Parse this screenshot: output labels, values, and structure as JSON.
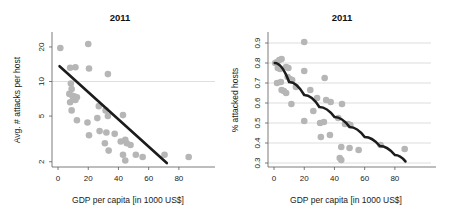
{
  "figure": {
    "background_color": "#ffffff",
    "point_color": "#b6b6b6",
    "line_color": "#1c1c1c",
    "grid_color": "#c8c8c8",
    "axis_color": "#5a5a5a"
  },
  "panels": {
    "left": {
      "title": "2011",
      "xlabel": "GDP per capita [in 1000 US$]",
      "ylabel": "Avg. # attacks per host",
      "xticks": [
        "0",
        "20",
        "40",
        "60",
        "80"
      ],
      "yticks": [
        "20",
        "10",
        "5",
        "2"
      ]
    },
    "right": {
      "title": "2011",
      "xlabel": "GDP per capita [in 1000 US$]",
      "ylabel": "% attacked hosts",
      "xticks": [
        "0",
        "20",
        "40",
        "60",
        "80"
      ],
      "yticks": [
        "0.9",
        "0.8",
        "0.7",
        "0.6",
        "0.5",
        "0.4",
        "0.3"
      ]
    }
  },
  "chart_data": [
    {
      "type": "scatter",
      "panel": "left",
      "title": "2011",
      "xlabel": "GDP per capita [in 1000 US$]",
      "ylabel": "Avg. # attacks per host",
      "yscale": "log",
      "xlim": [
        -4,
        92
      ],
      "ylim": [
        1.8,
        23
      ],
      "xticks": [
        0,
        20,
        40,
        60,
        80
      ],
      "yticks": [
        20,
        10,
        5,
        2
      ],
      "grid": "horizontal-at-10",
      "legend": "none",
      "points": [
        {
          "x": 1.5,
          "y": 19.6
        },
        {
          "x": 20.0,
          "y": 21.2
        },
        {
          "x": 8.0,
          "y": 13.2
        },
        {
          "x": 11.5,
          "y": 13.3
        },
        {
          "x": 20.5,
          "y": 13.0
        },
        {
          "x": 33.0,
          "y": 11.6
        },
        {
          "x": 8.5,
          "y": 9.6
        },
        {
          "x": 9.0,
          "y": 8.6
        },
        {
          "x": 7.5,
          "y": 7.8
        },
        {
          "x": 9.5,
          "y": 7.5
        },
        {
          "x": 11.0,
          "y": 7.4
        },
        {
          "x": 12.5,
          "y": 7.3
        },
        {
          "x": 8.0,
          "y": 6.6
        },
        {
          "x": 10.0,
          "y": 7.0
        },
        {
          "x": 11.5,
          "y": 6.9
        },
        {
          "x": 9.0,
          "y": 5.6
        },
        {
          "x": 27.0,
          "y": 6.1
        },
        {
          "x": 31.5,
          "y": 5.6
        },
        {
          "x": 12.5,
          "y": 4.6
        },
        {
          "x": 19.5,
          "y": 4.4
        },
        {
          "x": 26.0,
          "y": 4.8
        },
        {
          "x": 33.0,
          "y": 5.0
        },
        {
          "x": 43.0,
          "y": 5.1
        },
        {
          "x": 20.5,
          "y": 3.4
        },
        {
          "x": 27.5,
          "y": 3.7
        },
        {
          "x": 32.0,
          "y": 3.6
        },
        {
          "x": 37.5,
          "y": 3.5
        },
        {
          "x": 31.0,
          "y": 2.9
        },
        {
          "x": 41.5,
          "y": 3.0
        },
        {
          "x": 44.5,
          "y": 3.1
        },
        {
          "x": 45.5,
          "y": 2.9
        },
        {
          "x": 48.0,
          "y": 2.8
        },
        {
          "x": 33.5,
          "y": 2.5
        },
        {
          "x": 43.0,
          "y": 2.3
        },
        {
          "x": 44.5,
          "y": 2.05
        },
        {
          "x": 51.5,
          "y": 2.3
        },
        {
          "x": 56.0,
          "y": 2.2
        },
        {
          "x": 70.5,
          "y": 2.3
        },
        {
          "x": 86.5,
          "y": 2.2
        }
      ],
      "fit": {
        "type": "line",
        "x0": 1.0,
        "y0": 13.6,
        "x1": 72.0,
        "y1": 1.95
      }
    },
    {
      "type": "scatter",
      "panel": "right",
      "title": "2011",
      "xlabel": "GDP per capita [in 1000 US$]",
      "ylabel": "% attacked hosts",
      "yscale": "linear",
      "xlim": [
        -4,
        92
      ],
      "ylim": [
        0.28,
        0.93
      ],
      "xticks": [
        0,
        20,
        40,
        60,
        80
      ],
      "yticks": [
        0.9,
        0.8,
        0.7,
        0.6,
        0.5,
        0.4,
        0.3
      ],
      "grid": "horizontal",
      "legend": "none",
      "points": [
        {
          "x": 20.0,
          "y": 0.905
        },
        {
          "x": 0.8,
          "y": 0.8
        },
        {
          "x": 2.0,
          "y": 0.805
        },
        {
          "x": 3.5,
          "y": 0.815
        },
        {
          "x": 5.0,
          "y": 0.82
        },
        {
          "x": 2.5,
          "y": 0.775
        },
        {
          "x": 4.0,
          "y": 0.77
        },
        {
          "x": 8.0,
          "y": 0.78
        },
        {
          "x": 9.5,
          "y": 0.775
        },
        {
          "x": 20.0,
          "y": 0.76
        },
        {
          "x": 2.0,
          "y": 0.7
        },
        {
          "x": 4.5,
          "y": 0.705
        },
        {
          "x": 9.0,
          "y": 0.73
        },
        {
          "x": 10.5,
          "y": 0.72
        },
        {
          "x": 12.0,
          "y": 0.715
        },
        {
          "x": 33.5,
          "y": 0.725
        },
        {
          "x": 5.0,
          "y": 0.665
        },
        {
          "x": 6.5,
          "y": 0.66
        },
        {
          "x": 8.0,
          "y": 0.65
        },
        {
          "x": 14.5,
          "y": 0.68
        },
        {
          "x": 24.0,
          "y": 0.665
        },
        {
          "x": 11.5,
          "y": 0.595
        },
        {
          "x": 28.5,
          "y": 0.625
        },
        {
          "x": 34.5,
          "y": 0.615
        },
        {
          "x": 37.5,
          "y": 0.605
        },
        {
          "x": 45.0,
          "y": 0.595
        },
        {
          "x": 26.0,
          "y": 0.56
        },
        {
          "x": 20.0,
          "y": 0.51
        },
        {
          "x": 30.5,
          "y": 0.5
        },
        {
          "x": 33.0,
          "y": 0.505
        },
        {
          "x": 42.5,
          "y": 0.525
        },
        {
          "x": 47.0,
          "y": 0.495
        },
        {
          "x": 49.0,
          "y": 0.495
        },
        {
          "x": 50.5,
          "y": 0.49
        },
        {
          "x": 31.0,
          "y": 0.43
        },
        {
          "x": 37.0,
          "y": 0.44
        },
        {
          "x": 44.5,
          "y": 0.38
        },
        {
          "x": 50.0,
          "y": 0.375
        },
        {
          "x": 56.0,
          "y": 0.365
        },
        {
          "x": 70.5,
          "y": 0.39
        },
        {
          "x": 86.5,
          "y": 0.37
        },
        {
          "x": 43.5,
          "y": 0.325
        },
        {
          "x": 44.5,
          "y": 0.315
        }
      ],
      "fit": {
        "type": "curve",
        "points": [
          {
            "x": 0.5,
            "y": 0.8
          },
          {
            "x": 10.0,
            "y": 0.705
          },
          {
            "x": 20.0,
            "y": 0.64
          },
          {
            "x": 30.0,
            "y": 0.58
          },
          {
            "x": 40.0,
            "y": 0.53
          },
          {
            "x": 50.0,
            "y": 0.48
          },
          {
            "x": 60.0,
            "y": 0.43
          },
          {
            "x": 70.0,
            "y": 0.385
          },
          {
            "x": 80.0,
            "y": 0.34
          },
          {
            "x": 87.0,
            "y": 0.308
          }
        ]
      }
    }
  ]
}
